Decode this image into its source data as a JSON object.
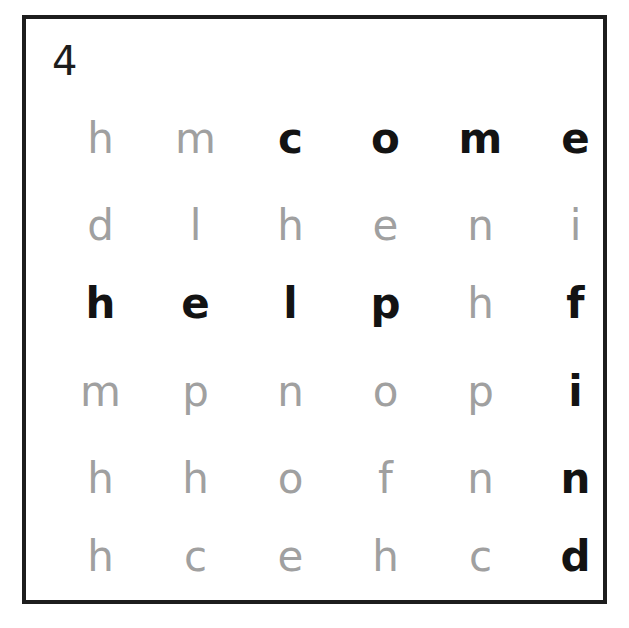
{
  "puzzle": {
    "number": "4",
    "type": "word-search",
    "columns": 6,
    "rows": 6,
    "grid": [
      [
        "h",
        "m",
        "c",
        "o",
        "m",
        "e"
      ],
      [
        "d",
        "l",
        "h",
        "e",
        "n",
        "i"
      ],
      [
        "h",
        "e",
        "l",
        "p",
        "h",
        "f"
      ],
      [
        "m",
        "p",
        "n",
        "o",
        "p",
        "i"
      ],
      [
        "h",
        "h",
        "o",
        "f",
        "n",
        "n"
      ],
      [
        "h",
        "c",
        "e",
        "h",
        "c",
        "d"
      ]
    ],
    "found_words": [
      {
        "word": "come",
        "direction": "horizontal",
        "row": 0,
        "start_col": 2,
        "end_col": 5,
        "cells": [
          [
            0,
            2
          ],
          [
            0,
            3
          ],
          [
            0,
            4
          ],
          [
            0,
            5
          ]
        ]
      },
      {
        "word": "help",
        "direction": "horizontal",
        "row": 2,
        "start_col": 0,
        "end_col": 3,
        "cells": [
          [
            2,
            0
          ],
          [
            2,
            1
          ],
          [
            2,
            2
          ],
          [
            2,
            3
          ]
        ]
      },
      {
        "word": "find",
        "direction": "vertical",
        "col": 5,
        "start_row": 2,
        "end_row": 5,
        "cells": [
          [
            2,
            5
          ],
          [
            3,
            5
          ],
          [
            4,
            5
          ],
          [
            5,
            5
          ]
        ]
      }
    ],
    "colors": {
      "frame": "#1d1d1d",
      "letter_unfound": "#a0a0a0",
      "letter_found": "#131313",
      "oval_stroke": "#5d5d5d",
      "background": "#ffffff"
    }
  }
}
